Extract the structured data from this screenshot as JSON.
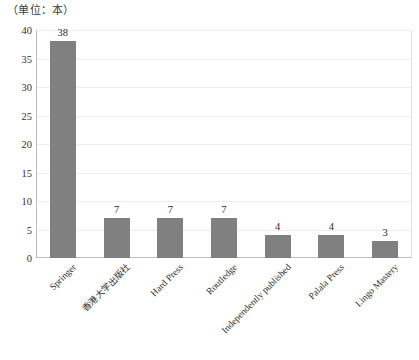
{
  "chart_data": {
    "type": "bar",
    "title": "",
    "subtitle": "",
    "unit_caption": "（单位：本）",
    "xlabel": "",
    "ylabel": "",
    "ylim": [
      0,
      40
    ],
    "ytick_interval": 5,
    "ytick_labels": [
      "0",
      "5",
      "10",
      "15",
      "20",
      "25",
      "30",
      "35",
      "40"
    ],
    "ytick_values": [
      0,
      5,
      10,
      15,
      20,
      25,
      30,
      35,
      40
    ],
    "grid": true,
    "legend": "none",
    "bar_color": "#808080",
    "axis_color": "#bdbdbd",
    "gridline_color": "#ededed",
    "categories": [
      "Springer",
      "香港大学出版社",
      "Hard Press",
      "Routledge",
      "Independently published",
      "Palala Press",
      "Lingo Mastery"
    ],
    "category_is_cjk": [
      false,
      true,
      false,
      false,
      false,
      false,
      false
    ],
    "values": [
      38,
      7,
      7,
      7,
      4,
      4,
      3
    ],
    "value_labels": [
      "38",
      "7",
      "7",
      "7",
      "4",
      "4",
      "3"
    ]
  }
}
